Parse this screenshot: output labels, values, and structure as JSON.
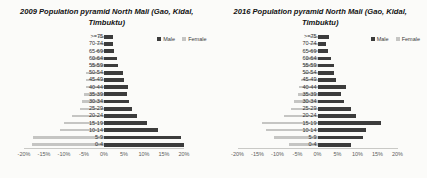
{
  "page": {
    "background": "#fbfbf9",
    "male_color": "#3c3c3c",
    "female_color": "#c5c5c3"
  },
  "chart_data": [
    {
      "type": "bar",
      "subtype": "population-pyramid",
      "title": "2009 Population pyramid North Mali (Gao, Kidal, Timbuktu)",
      "categories": [
        ">=75",
        "70-74",
        "65-69",
        "60-64",
        "55-59",
        "50-54",
        "45-49",
        "40-44",
        "35-39",
        "30-34",
        "25-29",
        "20-24",
        "15-19",
        "10-14",
        "5-9",
        "0-4"
      ],
      "series": [
        {
          "name": "Male",
          "side": "right",
          "color": "#3c3c3c",
          "values": [
            2.2,
            2.3,
            2.6,
            3.3,
            3.6,
            4.8,
            5.0,
            6.0,
            5.8,
            6.3,
            7.0,
            8.2,
            10.8,
            13.5,
            19.3,
            20.0
          ]
        },
        {
          "name": "Female",
          "side": "left",
          "color": "#c5c5c3",
          "values": [
            1.5,
            1.8,
            2.0,
            3.0,
            3.2,
            4.5,
            4.6,
            4.6,
            5.0,
            5.6,
            6.0,
            8.1,
            10.0,
            11.0,
            17.8,
            18.0
          ]
        }
      ],
      "x_ticks": [
        "-20%",
        "-15%",
        "-10%",
        "-5%",
        "0%",
        "5%",
        "10%",
        "15%",
        "20%"
      ],
      "xlim": [
        -20,
        20
      ],
      "xlabel": "",
      "ylabel": "",
      "grid": false,
      "legend_position": "top-right"
    },
    {
      "type": "bar",
      "subtype": "population-pyramid",
      "title": "2016 Population pyramid North Mali (Gao, Kidal, Timbuktu)",
      "categories": [
        ">=75",
        "70-74",
        "65-69",
        "60-64",
        "55-59",
        "50-54",
        "45-49",
        "40-44",
        "35-39",
        "30-34",
        "25-29",
        "20-24",
        "15-19",
        "10-14",
        "5-9",
        "0-4"
      ],
      "series": [
        {
          "name": "Male",
          "side": "right",
          "color": "#3c3c3c",
          "values": [
            2.8,
            2.2,
            2.5,
            3.3,
            4.2,
            4.2,
            4.6,
            7.0,
            5.8,
            6.7,
            8.3,
            9.6,
            15.8,
            12.1,
            11.3,
            8.3
          ]
        },
        {
          "name": "Female",
          "side": "left",
          "color": "#c5c5c3",
          "values": [
            2.0,
            2.0,
            2.5,
            3.0,
            3.5,
            3.5,
            4.2,
            4.6,
            5.0,
            5.8,
            6.7,
            8.3,
            13.8,
            13.0,
            10.8,
            7.1
          ]
        }
      ],
      "x_ticks": [
        "-20%",
        "-15%",
        "-10%",
        "-5%",
        "0%",
        "5%",
        "10%",
        "15%",
        "20%"
      ],
      "xlim": [
        -20,
        20
      ],
      "xlabel": "",
      "ylabel": "",
      "grid": false,
      "legend_position": "top-right"
    }
  ]
}
